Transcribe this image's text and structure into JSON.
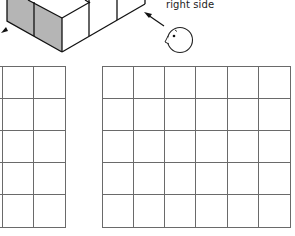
{
  "figure": {
    "view_label": "right side",
    "colors": {
      "stroke": "#111111",
      "shaded_face": "#b5b5b5",
      "grid_line": "#6a6a6a",
      "background": "#ffffff"
    },
    "cube_model": {
      "description": "isometric stack of unit cubes, left faces shaded gray, partially cropped at top"
    },
    "observer": {
      "icon": "bird-head-icon",
      "looking_direction": "toward right side of cube model"
    },
    "grids": [
      {
        "name": "left-grid",
        "rows": 5,
        "cols": 3,
        "note": "cropped at left edge"
      },
      {
        "name": "right-grid",
        "rows": 5,
        "cols": 6
      }
    ]
  }
}
